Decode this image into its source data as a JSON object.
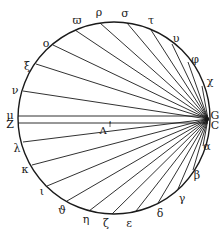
{
  "diagram": {
    "type": "geometric-figure",
    "circle": {
      "cx": 114,
      "cy": 118,
      "r": 96
    },
    "focus_point": {
      "labels": [
        "G",
        "C"
      ],
      "x": 208,
      "y": 119
    },
    "stroke_color": "#1a1a1a",
    "background_color": "#ffffff",
    "interior_label": {
      "text": "Λ",
      "x": 103,
      "y": 131,
      "tick_text": "'"
    },
    "horizontal_lines": [
      {
        "from_label": "μ",
        "y": 116
      },
      {
        "from_label": "Z",
        "y": 123
      }
    ],
    "points": [
      {
        "label": "ϖ",
        "lx": 77,
        "ly": 20,
        "px": 75,
        "py": 30
      },
      {
        "label": "ρ",
        "lx": 99,
        "ly": 12,
        "px": 100,
        "py": 23
      },
      {
        "label": "σ",
        "lx": 125,
        "ly": 13,
        "px": 127,
        "py": 23
      },
      {
        "label": "τ",
        "lx": 151,
        "ly": 20,
        "px": 151,
        "py": 30
      },
      {
        "label": "υ",
        "lx": 176,
        "ly": 38,
        "px": 172,
        "py": 44
      },
      {
        "label": "φ",
        "lx": 195,
        "ly": 59,
        "px": 188,
        "py": 62
      },
      {
        "label": "χ",
        "lx": 210,
        "ly": 81,
        "px": 202,
        "py": 86
      },
      {
        "label": "α",
        "lx": 207,
        "ly": 146,
        "px": 203,
        "py": 146
      },
      {
        "label": "β",
        "lx": 197,
        "ly": 175,
        "px": 193,
        "py": 170
      },
      {
        "label": "γ",
        "lx": 182,
        "ly": 198,
        "px": 178,
        "py": 189
      },
      {
        "label": "δ",
        "lx": 160,
        "ly": 213,
        "px": 158,
        "py": 203
      },
      {
        "label": "ε",
        "lx": 129,
        "ly": 223,
        "px": 136,
        "py": 211
      },
      {
        "label": "ζ",
        "lx": 106,
        "ly": 223,
        "px": 112,
        "py": 214
      },
      {
        "label": "η",
        "lx": 86,
        "ly": 219,
        "px": 89,
        "py": 211
      },
      {
        "label": "ϑ",
        "lx": 62,
        "ly": 210,
        "px": 67,
        "py": 201
      },
      {
        "label": "ι",
        "lx": 42,
        "ly": 191,
        "px": 47,
        "py": 186
      },
      {
        "label": "κ",
        "lx": 25,
        "ly": 169,
        "px": 32,
        "py": 165
      },
      {
        "label": "λ",
        "lx": 17,
        "ly": 148,
        "px": 23,
        "py": 142
      },
      {
        "label": "Z",
        "lx": 10,
        "ly": 124,
        "px": 18,
        "py": 123
      },
      {
        "label": "μ",
        "lx": 10,
        "ly": 115,
        "px": 18,
        "py": 116
      },
      {
        "label": "ν",
        "lx": 15,
        "ly": 90,
        "px": 23,
        "py": 91
      },
      {
        "label": "ξ",
        "lx": 27,
        "ly": 66,
        "px": 36,
        "py": 64
      },
      {
        "label": "ο",
        "lx": 46,
        "ly": 43,
        "px": 53,
        "py": 45
      }
    ]
  }
}
